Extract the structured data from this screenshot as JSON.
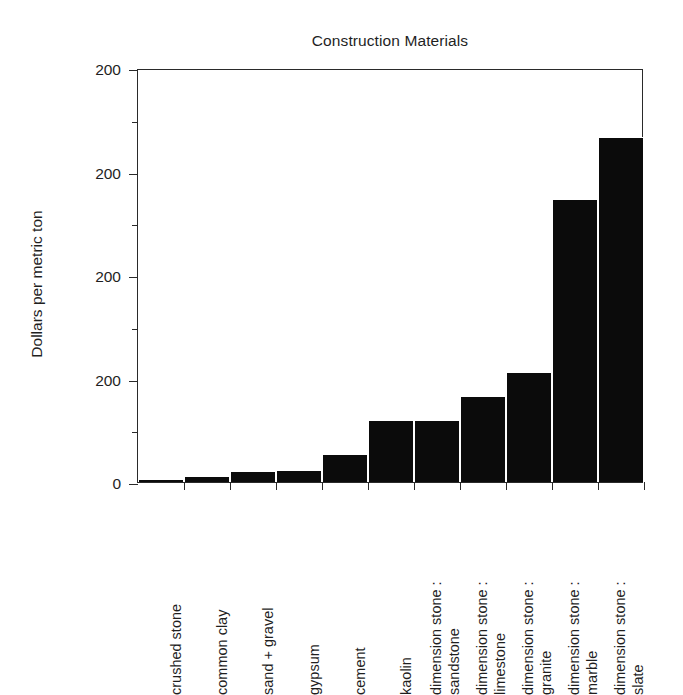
{
  "chart_data": {
    "type": "bar",
    "title": "Construction Materials",
    "xlabel": "",
    "ylabel": "Dollars per metric ton",
    "ylim": [
      0,
      300
    ],
    "grid": false,
    "legend": null,
    "orientation": "vertical",
    "bar_color": "#0b0b0b",
    "axis_color": "#2a2a2a",
    "y_tick_labels": [
      "200",
      "200",
      "200",
      "200",
      "0"
    ],
    "y_tick_values": [
      300,
      225,
      150,
      75,
      0
    ],
    "y_minor_tick_values": [
      262.5,
      187.5,
      112.5,
      37.5
    ],
    "note": "Y axis tick labels are printed as '200' at every major tick in the source scan; only the bottom tick reads '0'.",
    "categories": [
      "crushed stone",
      "common clay",
      "sand + gravel",
      "gypsum",
      "cement",
      "kaolin",
      "dimension stone : sandstone",
      "dimension stone : limestone",
      "dimension stone : granite",
      "dimension stone : marble",
      "dimension stone : slate"
    ],
    "category_lines": [
      [
        "crushed stone"
      ],
      [
        "common clay"
      ],
      [
        "sand + gravel"
      ],
      [
        "gypsum"
      ],
      [
        "cement"
      ],
      [
        "kaolin"
      ],
      [
        "dimension stone :",
        "sandstone"
      ],
      [
        "dimension stone :",
        "limestone"
      ],
      [
        "dimension stone :",
        "granite"
      ],
      [
        "dimension stone :",
        "marble"
      ],
      [
        "dimension stone :",
        "slate"
      ]
    ],
    "values": [
      2,
      4,
      8,
      9,
      20,
      45,
      45,
      62,
      80,
      205,
      250
    ]
  }
}
